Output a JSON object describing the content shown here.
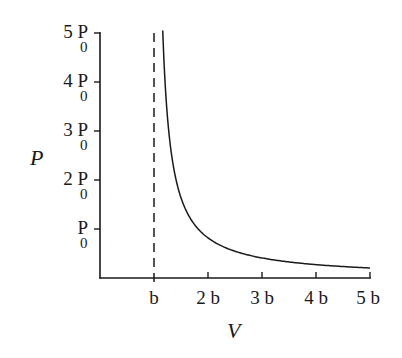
{
  "chart_data": {
    "type": "line",
    "title": "",
    "xlabel": "V",
    "ylabel": "P",
    "x_ticks": [
      {
        "value": 1,
        "label": "b"
      },
      {
        "value": 2,
        "label": "2 b"
      },
      {
        "value": 3,
        "label": "3 b"
      },
      {
        "value": 4,
        "label": "4 b"
      },
      {
        "value": 5,
        "label": "5 b"
      }
    ],
    "y_ticks": [
      {
        "value": 1,
        "coef": "",
        "base": "P",
        "sub": "0"
      },
      {
        "value": 2,
        "coef": "2 ",
        "base": "P",
        "sub": "0"
      },
      {
        "value": 3,
        "coef": "3 ",
        "base": "P",
        "sub": "0"
      },
      {
        "value": 4,
        "coef": "4 ",
        "base": "P",
        "sub": "0"
      },
      {
        "value": 5,
        "coef": "5 ",
        "base": "P",
        "sub": "0"
      }
    ],
    "xlim": [
      0,
      5
    ],
    "ylim": [
      0,
      5
    ],
    "x_unit": "b",
    "y_unit": "P0",
    "grid": false,
    "legend": null,
    "series": [
      {
        "name": "P(V)",
        "style": "solid",
        "description": "Hyperbola-like curve asymptotic to V = b, approximately P = 0.8 P0 * b / (V - b)",
        "x": [
          1.17,
          1.24,
          1.4,
          1.6,
          2.0,
          2.5,
          3.0,
          3.5,
          4.0,
          4.5,
          5.0
        ],
        "y": [
          5.0,
          3.1,
          2.0,
          1.35,
          0.75,
          0.55,
          0.42,
          0.33,
          0.28,
          0.24,
          0.22
        ]
      }
    ],
    "annotations": [
      {
        "type": "vertical-dashed-line",
        "x": 1,
        "label": "V = b asymptote"
      }
    ]
  },
  "labels": {
    "x_axis_title": "V",
    "y_axis_title": "P",
    "x1": "b",
    "x2": "2 b",
    "x3": "3 b",
    "x4": "4 b",
    "x5": "5 b",
    "y1_coef": "",
    "y2_coef": "2 ",
    "y3_coef": "3 ",
    "y4_coef": "4 ",
    "y5_coef": "5 ",
    "y_base": "P",
    "y_sub": "0"
  },
  "colors": {
    "ink": "#1a1a1a",
    "background": "#ffffff"
  }
}
